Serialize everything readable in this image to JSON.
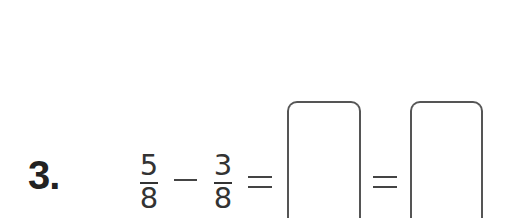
{
  "problem": {
    "number_label": "3.",
    "expression": {
      "fraction_1": {
        "numerator": "5",
        "denominator": "8"
      },
      "operator": "−",
      "fraction_2": {
        "numerator": "3",
        "denominator": "8"
      },
      "equals_1": "=",
      "equals_2": "="
    },
    "answer_boxes": [
      {
        "value": ""
      },
      {
        "value": ""
      }
    ]
  }
}
